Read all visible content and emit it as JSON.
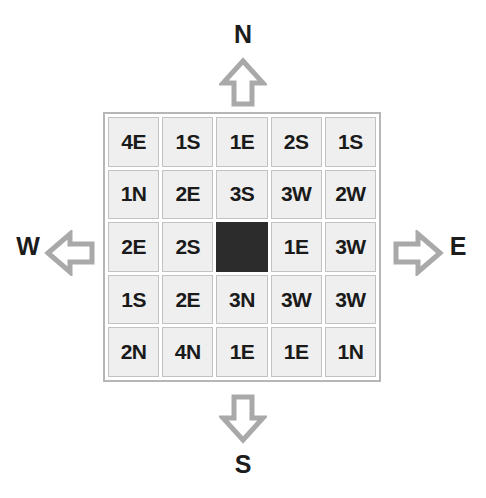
{
  "compass": {
    "north": {
      "label": "N",
      "icon": "arrow-up-icon"
    },
    "south": {
      "label": "S",
      "icon": "arrow-down-icon"
    },
    "west": {
      "label": "W",
      "icon": "arrow-left-icon"
    },
    "east": {
      "label": "E",
      "icon": "arrow-right-icon"
    }
  },
  "grid": {
    "rows": 5,
    "columns": 5,
    "cells": [
      [
        {
          "value": "4E",
          "blocked": false
        },
        {
          "value": "1S",
          "blocked": false
        },
        {
          "value": "1E",
          "blocked": false
        },
        {
          "value": "2S",
          "blocked": false
        },
        {
          "value": "1S",
          "blocked": false
        }
      ],
      [
        {
          "value": "1N",
          "blocked": false
        },
        {
          "value": "2E",
          "blocked": false
        },
        {
          "value": "3S",
          "blocked": false
        },
        {
          "value": "3W",
          "blocked": false
        },
        {
          "value": "2W",
          "blocked": false
        }
      ],
      [
        {
          "value": "2E",
          "blocked": false
        },
        {
          "value": "2S",
          "blocked": false
        },
        {
          "value": "",
          "blocked": true
        },
        {
          "value": "1E",
          "blocked": false
        },
        {
          "value": "3W",
          "blocked": false
        }
      ],
      [
        {
          "value": "1S",
          "blocked": false
        },
        {
          "value": "2E",
          "blocked": false
        },
        {
          "value": "3N",
          "blocked": false
        },
        {
          "value": "3W",
          "blocked": false
        },
        {
          "value": "3W",
          "blocked": false
        }
      ],
      [
        {
          "value": "2N",
          "blocked": false
        },
        {
          "value": "4N",
          "blocked": false
        },
        {
          "value": "1E",
          "blocked": false
        },
        {
          "value": "1E",
          "blocked": false
        },
        {
          "value": "1N",
          "blocked": false
        }
      ]
    ]
  },
  "colors": {
    "cell_background": "#efefef",
    "cell_border": "#c2c2c2",
    "blocked_cell": "#2c2c2c",
    "grid_border": "#b6b6b6",
    "arrow_stroke": "#a9a9a9",
    "text": "#1a1a1a"
  }
}
